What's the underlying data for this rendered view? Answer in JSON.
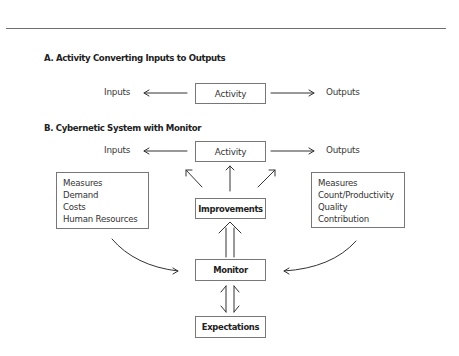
{
  "section_a": {
    "heading": "A. Activity Converting Inputs to Outputs",
    "inputs_label": "Inputs",
    "activity_label": "Activity",
    "outputs_label": "Outputs"
  },
  "section_b": {
    "heading": "B. Cybernetic System with Monitor",
    "inputs_label": "Inputs",
    "activity_label": "Activity",
    "outputs_label": "Outputs",
    "improvements_label": "Improvements",
    "monitor_label": "Monitor",
    "expectations_label": "Expectations",
    "input_measures": [
      "Measures",
      "Demand",
      "Costs",
      "Human Resources"
    ],
    "output_measures": [
      "Measures",
      "Count/Productivity",
      "Quality",
      "Contribution"
    ]
  }
}
